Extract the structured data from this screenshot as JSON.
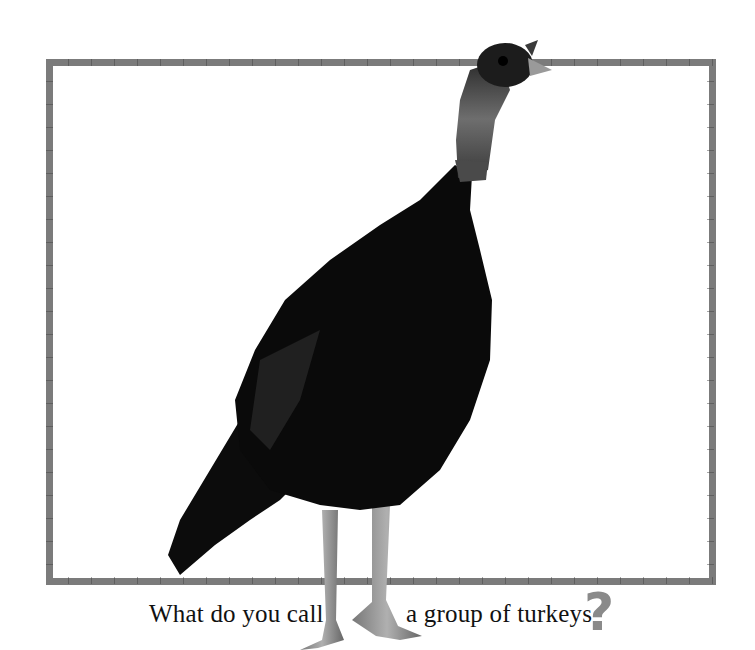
{
  "page": {
    "caption_part1": "What do you call",
    "caption_part2": "a group of turkeys",
    "question_mark": "?",
    "image_subject": "wild turkey standing",
    "colors": {
      "frame": "#7b7b7b",
      "question_mark": "#8a8a8a",
      "text": "#111111",
      "background": "#ffffff"
    }
  }
}
